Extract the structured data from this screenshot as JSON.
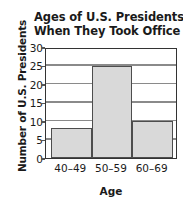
{
  "chart_data": {
    "type": "bar",
    "title": "Ages of U.S. Presidents When They Took Office",
    "title_lines": [
      "Ages of U.S. Presidents",
      "When They Took Office"
    ],
    "categories": [
      "40–49",
      "50–59",
      "60–69"
    ],
    "values": [
      8,
      25,
      10
    ],
    "xlabel": "Age",
    "ylabel": "Number of U.S. Presidents",
    "ylim": [
      0,
      30
    ],
    "ytick_labels": [
      "0",
      "5",
      "10",
      "15",
      "20",
      "25",
      "30"
    ],
    "ytick_values": [
      0,
      5,
      10,
      15,
      20,
      25,
      30
    ],
    "grid": "horizontal",
    "legend": "none",
    "bar_fill_color": "#d9d9d9",
    "bar_border_color": "#4d4d4d",
    "gridline_color": "#8a8a8a",
    "axis_color": "#333333",
    "text_color": "#1a1a1a"
  }
}
